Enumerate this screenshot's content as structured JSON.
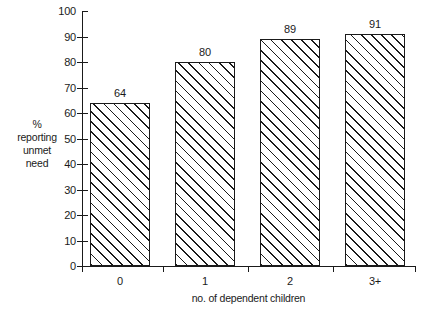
{
  "chart_data": {
    "type": "bar",
    "title": "",
    "categories": [
      "0",
      "1",
      "2",
      "3+"
    ],
    "values": [
      64,
      80,
      89,
      91
    ],
    "value_labels": [
      "64",
      "80",
      "89",
      "91"
    ],
    "xlabel": "no. of dependent children",
    "ylabel": "% reporting unmet need",
    "ylabel_lines": [
      "%",
      "reporting",
      "unmet",
      "need"
    ],
    "ylim": [
      0,
      100
    ],
    "ytick_labels": [
      "0",
      "10",
      "20",
      "30",
      "40",
      "50",
      "60",
      "70",
      "80",
      "90",
      "100"
    ],
    "ytick_values": [
      0,
      10,
      20,
      30,
      40,
      50,
      60,
      70,
      80,
      90,
      100
    ],
    "grid": false,
    "legend": null,
    "bar_fill": "hatch-diagonal-45",
    "bar_edge_color": "#1a1a1a",
    "bar_face_color": "#ffffff",
    "background_color": "#ffffff"
  }
}
